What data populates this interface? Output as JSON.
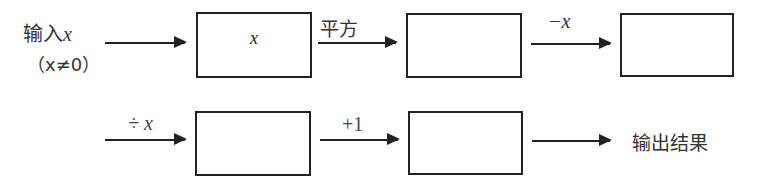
{
  "diagram": {
    "type": "flowchart",
    "input": {
      "text": "输入",
      "var": "x",
      "condition": "（x≠0）"
    },
    "boxes": [
      {
        "id": "box1",
        "content": "x"
      },
      {
        "id": "box2",
        "content": ""
      },
      {
        "id": "box3",
        "content": ""
      },
      {
        "id": "box4",
        "content": ""
      },
      {
        "id": "box5",
        "content": ""
      }
    ],
    "operations": [
      {
        "from": "input",
        "to": "box1",
        "label": ""
      },
      {
        "from": "box1",
        "to": "box2",
        "label": "平方"
      },
      {
        "from": "box2",
        "to": "box3",
        "label": "−x"
      },
      {
        "from": "box3",
        "to": "box4",
        "label": "÷ x"
      },
      {
        "from": "box4",
        "to": "box5",
        "label": "+1"
      },
      {
        "from": "box5",
        "to": "output",
        "label": ""
      }
    ],
    "output": {
      "text": "输出结果"
    }
  }
}
